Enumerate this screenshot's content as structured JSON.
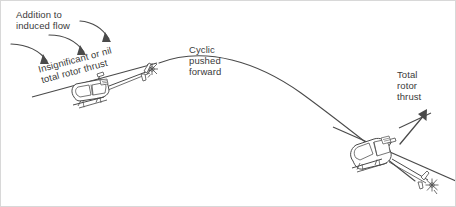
{
  "figure": {
    "title_text": "",
    "background_color": "#ffffff",
    "ink_color": "#3f3f3f",
    "text_color": "#3a3a3a",
    "border_color": "#d8d8d8"
  },
  "labels": {
    "addition_to_induced_flow": "Addition to\ninduced flow",
    "insignificant_or_nil_total_rotor_thrust": "Insignificant or nil\ntotal rotor thrust",
    "cyclic_pushed_forward": "Cyclic\npushed\nforward",
    "total_rotor_thrust": "Total\nrotor\nthrust"
  },
  "icons": {
    "helicopter_left": "helicopter-nose-up-icon",
    "helicopter_right": "helicopter-nose-down-icon",
    "flight_path": "flight-path-curve-icon",
    "induced_flow_arrow_1": "curved-arrow-down-right-icon",
    "induced_flow_arrow_2": "curved-arrow-down-right-icon",
    "induced_flow_arrow_3": "curved-arrow-down-right-icon",
    "thrust_arrow": "straight-arrow-up-right-icon",
    "rotor_disc_left": "rotor-disc-line-icon",
    "rotor_disc_right": "rotor-disc-line-icon"
  }
}
